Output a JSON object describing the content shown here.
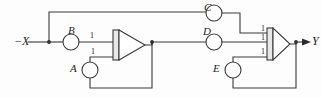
{
  "diagram": {
    "line_color": "#3a3a3a",
    "text_color": "#1c1c1c",
    "background": "#fdfdfd",
    "inputs": [
      {
        "id": "x",
        "label": "−X"
      }
    ],
    "outputs": [
      {
        "id": "y",
        "label": "Y"
      }
    ],
    "nodes": [
      {
        "id": "a",
        "label": "A",
        "x": 83,
        "y": 70,
        "r": 8
      },
      {
        "id": "b",
        "label": "B",
        "x": 71,
        "y": 42,
        "r": 8
      },
      {
        "id": "c",
        "label": "C",
        "x": 214,
        "y": 13,
        "r": 8
      },
      {
        "id": "d",
        "label": "D",
        "x": 214,
        "y": 42,
        "r": 8
      },
      {
        "id": "e",
        "label": "E",
        "x": 226,
        "y": 70,
        "r": 8
      }
    ],
    "gates": [
      {
        "id": "gate1",
        "type": "or-gate-iec",
        "symbol_label": "1",
        "input_labels": [
          "1",
          "1"
        ],
        "x": 104,
        "y": 30
      },
      {
        "id": "gate2",
        "type": "or-gate-iec",
        "symbol_label": "1",
        "input_labels": [
          "1",
          "1",
          "1"
        ],
        "x": 258,
        "y": 30
      }
    ],
    "gate_input_markers": [
      {
        "id": "g1-in1",
        "label": "1",
        "x": 90,
        "y": 33
      },
      {
        "id": "g1-in2",
        "label": "1",
        "x": 90,
        "y": 55
      },
      {
        "id": "g2-in1",
        "label": "1",
        "x": 244,
        "y": 30
      },
      {
        "id": "g2-in2",
        "label": "1",
        "x": 244,
        "y": 38
      },
      {
        "id": "g2-in3",
        "label": "1",
        "x": 244,
        "y": 55
      }
    ]
  }
}
